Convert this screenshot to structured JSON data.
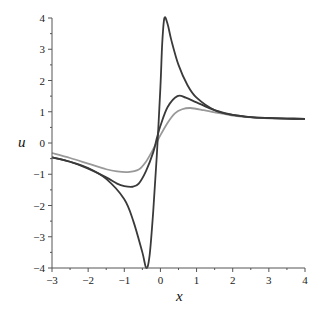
{
  "chart_data": {
    "type": "line",
    "title": "",
    "xlabel": "x",
    "ylabel": "u",
    "xlim": [
      -3,
      4
    ],
    "ylim": [
      -4,
      4
    ],
    "x_ticks": [
      -3,
      -2,
      -1,
      0,
      1,
      2,
      3,
      4
    ],
    "y_ticks": [
      -4,
      -3,
      -2,
      -1,
      0,
      1,
      2,
      3,
      4
    ],
    "grid": false,
    "legend": null,
    "series": [
      {
        "name": "curve-1 (tallest, dark)",
        "color": "#3a3a3a",
        "x": [
          -3,
          -2.5,
          -2,
          -1.5,
          -1,
          -0.75,
          -0.5,
          -0.39,
          -0.3,
          -0.2,
          -0.1,
          0,
          0.05,
          0.11,
          0.2,
          0.3,
          0.5,
          0.75,
          1,
          1.5,
          2,
          2.5,
          3,
          3.5,
          4
        ],
        "y": [
          -0.46,
          -0.6,
          -0.8,
          -1.15,
          -1.8,
          -2.5,
          -3.5,
          -4.0,
          -3.6,
          -2.2,
          -0.4,
          1.8,
          3.2,
          4.0,
          3.8,
          3.3,
          2.5,
          1.85,
          1.45,
          1.05,
          0.9,
          0.83,
          0.8,
          0.78,
          0.77
        ]
      },
      {
        "name": "curve-2 (middle, dark)",
        "color": "#3a3a3a",
        "x": [
          -3,
          -2.5,
          -2,
          -1.5,
          -1.2,
          -1,
          -0.77,
          -0.6,
          -0.4,
          -0.2,
          -0.1,
          0,
          0.2,
          0.47,
          0.7,
          1,
          1.5,
          2,
          2.5,
          3,
          3.5,
          4
        ],
        "y": [
          -0.46,
          -0.6,
          -0.82,
          -1.1,
          -1.3,
          -1.38,
          -1.4,
          -1.3,
          -0.9,
          -0.3,
          0.15,
          0.55,
          1.15,
          1.5,
          1.45,
          1.3,
          1.05,
          0.9,
          0.83,
          0.8,
          0.78,
          0.77
        ]
      },
      {
        "name": "curve-3 (flattest, light gray)",
        "color": "#999999",
        "x": [
          -3,
          -2.5,
          -2,
          -1.5,
          -1.2,
          -0.9,
          -0.6,
          -0.4,
          -0.2,
          0,
          0.2,
          0.4,
          0.6,
          0.83,
          1.2,
          1.5,
          2,
          2.5,
          3,
          3.5,
          4
        ],
        "y": [
          -0.32,
          -0.48,
          -0.66,
          -0.84,
          -0.91,
          -0.93,
          -0.85,
          -0.6,
          -0.2,
          0.25,
          0.65,
          0.95,
          1.08,
          1.12,
          1.05,
          0.98,
          0.88,
          0.82,
          0.79,
          0.78,
          0.77
        ]
      }
    ]
  }
}
